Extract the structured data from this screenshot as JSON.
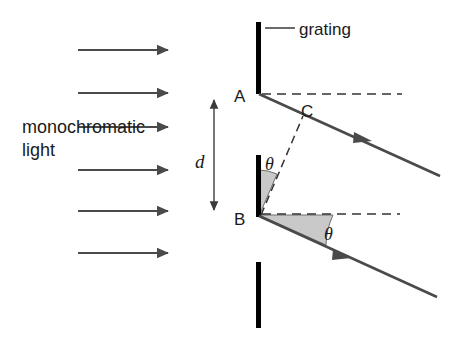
{
  "figure": {
    "type": "diffraction-grating-path-difference-diagram",
    "background_color": "#ffffff",
    "width": 464,
    "height": 345,
    "labels": {
      "grating": "grating",
      "monochromatic_line1": "monochromatic",
      "monochromatic_line2": "light",
      "point_a": "A",
      "point_b": "B",
      "point_c": "C",
      "slit_spacing": "d",
      "angle_upper": "θ",
      "angle_lower": "θ"
    },
    "colors": {
      "grating_bar": "#000000",
      "ray_line": "#4a4a4a",
      "dashed_line": "#333333",
      "angle_fill": "#c9c9c9",
      "angle_stroke": "#6e6e6e",
      "text": "#1a1a1a",
      "dimension_arrow": "#555555"
    },
    "incident_arrows": {
      "count": 6,
      "direction": "rightward",
      "x_start": 78,
      "x_end": 168,
      "y_positions": [
        50,
        93,
        127,
        170,
        211,
        253
      ]
    },
    "grating_bars": [
      {
        "name": "top-bar",
        "x": 258,
        "y_top": 22,
        "y_bottom": 94
      },
      {
        "name": "middle-bar",
        "x": 258,
        "y_top": 155,
        "y_bottom": 217
      },
      {
        "name": "bottom-bar",
        "x": 258,
        "y_top": 262,
        "y_bottom": 328
      }
    ],
    "points": {
      "A": {
        "x": 259,
        "y": 94
      },
      "B": {
        "x": 259,
        "y": 216
      },
      "C": {
        "x": 300,
        "y": 118
      }
    },
    "diffracted_rays": [
      {
        "name": "ray-from-a",
        "x1": 259,
        "y1": 94,
        "x2": 440,
        "y2": 176,
        "arrow_at": 0.62
      },
      {
        "name": "ray-from-b",
        "x1": 259,
        "y1": 216,
        "x2": 437,
        "y2": 297,
        "arrow_at": 0.5
      }
    ],
    "reference_dashed_lines": [
      {
        "name": "dashed-from-a",
        "x1": 262,
        "y1": 94,
        "x2": 402,
        "y2": 94
      },
      {
        "name": "dashed-from-b",
        "x1": 262,
        "y1": 214,
        "x2": 400,
        "y2": 214
      },
      {
        "name": "dashed-bc-wavefront",
        "x1": 262,
        "y1": 214,
        "x2": 302,
        "y2": 118
      }
    ],
    "dimension": {
      "name": "slit-spacing-d",
      "x": 214,
      "y_top": 95,
      "y_bottom": 215,
      "label_x": 201,
      "label_y": 162
    },
    "leader_line": {
      "x1": 265,
      "y1": 28,
      "x2": 295,
      "y2": 28
    },
    "angle_arcs": [
      {
        "name": "upper-theta-arc",
        "vertex_x": 259,
        "vertex_y": 216,
        "radius": 46,
        "start_deg": -90,
        "end_deg": -67
      },
      {
        "name": "lower-theta-arc",
        "vertex_x": 259,
        "vertex_y": 216,
        "radius": 74,
        "start_deg": 0,
        "end_deg": 24
      }
    ]
  }
}
